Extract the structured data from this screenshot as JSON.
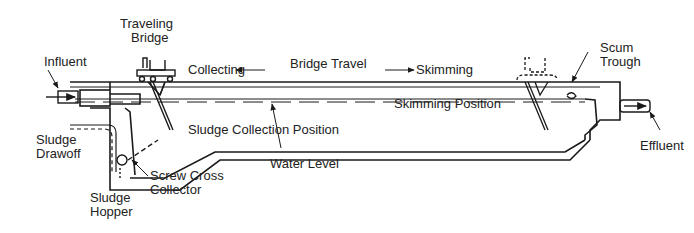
{
  "colors": {
    "line": "#1a1a1a",
    "text": "#222222",
    "background": "#ffffff"
  },
  "labels": {
    "traveling_bridge": [
      "Traveling",
      "Bridge"
    ],
    "influent": "Influent",
    "collecting": "Collecting",
    "bridge_travel": "Bridge Travel",
    "skimming": "Skimming",
    "scum_trough": [
      "Scum",
      "Trough"
    ],
    "skimming_position": "Skimming Position",
    "sludge_collection_position": "Sludge Collection Position",
    "sludge_drawoff": [
      "Sludge",
      "Drawoff"
    ],
    "screw_cross_collector": [
      "Screw Cross",
      "Collector"
    ],
    "water_level": "Water Level",
    "effluent": "Effluent",
    "sludge_hopper": [
      "Sludge",
      "Hopper"
    ]
  }
}
